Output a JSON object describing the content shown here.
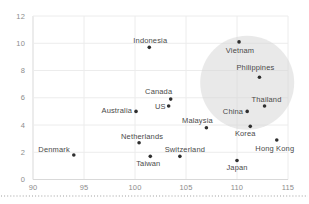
{
  "chart_data": {
    "type": "scatter",
    "title": "",
    "xlabel": "",
    "ylabel": "",
    "x_axis": {
      "min": 90,
      "max": 115,
      "ticks": [
        90,
        95,
        100,
        105,
        110,
        115
      ]
    },
    "y_axis": {
      "min": 0,
      "max": 12,
      "ticks": [
        0,
        2,
        4,
        6,
        8,
        10,
        12
      ]
    },
    "grid": true,
    "legend": false,
    "points": [
      {
        "name": "Denmark",
        "x": 94.0,
        "y": 1.8,
        "label_anchor": "end",
        "label_dx": -4,
        "label_dy": -3
      },
      {
        "name": "Indonesia",
        "x": 101.4,
        "y": 9.7,
        "label_anchor": "middle",
        "label_dx": 1,
        "label_dy": -4.5
      },
      {
        "name": "Vietnam",
        "x": 110.2,
        "y": 10.1,
        "label_anchor": "middle",
        "label_dx": 1,
        "label_dy": 11
      },
      {
        "name": "Philippines",
        "x": 112.2,
        "y": 7.5,
        "label_anchor": "middle",
        "label_dx": -4,
        "label_dy": -7
      },
      {
        "name": "Canada",
        "x": 103.5,
        "y": 5.9,
        "label_anchor": "middle",
        "label_dx": -12,
        "label_dy": -5
      },
      {
        "name": "US",
        "x": 103.3,
        "y": 5.4,
        "label_anchor": "end",
        "label_dx": -3,
        "label_dy": 3.5
      },
      {
        "name": "Australia",
        "x": 100.1,
        "y": 5.0,
        "label_anchor": "end",
        "label_dx": -4,
        "label_dy": 2
      },
      {
        "name": "Thailand",
        "x": 112.7,
        "y": 5.4,
        "label_anchor": "middle",
        "label_dx": 2,
        "label_dy": -4
      },
      {
        "name": "China",
        "x": 111.0,
        "y": 5.0,
        "label_anchor": "end",
        "label_dx": -4,
        "label_dy": 2.5
      },
      {
        "name": "Malaysia",
        "x": 107.0,
        "y": 3.8,
        "label_anchor": "middle",
        "label_dx": -9,
        "label_dy": -5
      },
      {
        "name": "Korea",
        "x": 111.3,
        "y": 3.9,
        "label_anchor": "middle",
        "label_dx": -5,
        "label_dy": 10
      },
      {
        "name": "Netherlands",
        "x": 100.4,
        "y": 2.7,
        "label_anchor": "middle",
        "label_dx": 3,
        "label_dy": -4
      },
      {
        "name": "Switzerland",
        "x": 104.4,
        "y": 1.7,
        "label_anchor": "middle",
        "label_dx": 5,
        "label_dy": -4
      },
      {
        "name": "Taiwan",
        "x": 101.5,
        "y": 1.7,
        "label_anchor": "middle",
        "label_dx": -2,
        "label_dy": 10
      },
      {
        "name": "Hong Kong",
        "x": 113.9,
        "y": 2.9,
        "label_anchor": "middle",
        "label_dx": -2,
        "label_dy": 11
      },
      {
        "name": "Japan",
        "x": 110.0,
        "y": 1.4,
        "label_anchor": "middle",
        "label_dx": 0,
        "label_dy": 10
      }
    ],
    "highlight": {
      "x": 111.0,
      "y": 7.1,
      "radius_px": 47,
      "color": "#d4d4d4",
      "opacity": 0.5
    },
    "separator": {
      "style": "dotted",
      "color": "#9e9e9e"
    },
    "colors": {
      "point": "#2f2f2f",
      "label": "#4a4a4a",
      "tick": "#8c8c8c",
      "grid": "#ececec",
      "axis": "#d9d9d9",
      "background": "#ffffff"
    }
  }
}
